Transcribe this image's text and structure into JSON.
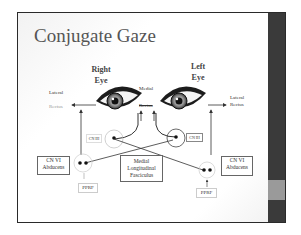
{
  "slide": {
    "title": "Conjugate Gaze",
    "right_eye": {
      "line1": "Right",
      "line2": "Eye"
    },
    "left_eye": {
      "line1": "Left",
      "line2": "Eye"
    },
    "labels": {
      "lateral_left": "Lateral",
      "rectus_left": "Rectus",
      "medial": "Medial",
      "rectus_medial": "Rectus",
      "lateral_right": "Lateral",
      "rectus_right": "Rectus"
    },
    "nodes": {
      "cn3_left": "CN III",
      "cn3_right": "CN III",
      "cn6_left": {
        "line1": "CN VI",
        "line2": "Abducens"
      },
      "cn6_right": {
        "line1": "CN VI",
        "line2": "Abducens"
      },
      "mlf": {
        "line1": "Medial",
        "line2": "Longitudinal",
        "line3": "Fasciculus"
      },
      "pprf_left": "PPRF",
      "pprf_right": "PPRF"
    }
  },
  "colors": {
    "sidebar": "#3a3a3a",
    "sidebar_accent": "#9a9a9a",
    "title": "#555555",
    "line": "#333333"
  }
}
